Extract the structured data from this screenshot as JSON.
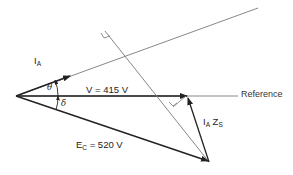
{
  "diagram": {
    "type": "phasor-diagram",
    "labels": {
      "current": {
        "main": "I",
        "sub": "A"
      },
      "voltage": "V = 415 V",
      "emf": {
        "main": "E",
        "sub": "C",
        "rest": " = 520 V"
      },
      "impedance_drop": {
        "main1": "I",
        "sub1": "A",
        "main2": " Z",
        "sub2": "S"
      },
      "reference": "Reference",
      "theta": "θ",
      "delta": "δ"
    },
    "colors": {
      "line": "#222222",
      "thin_line": "#777777",
      "text": "#222222"
    }
  }
}
